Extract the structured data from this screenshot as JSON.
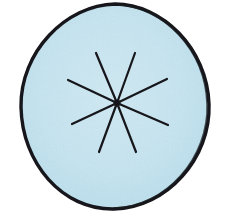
{
  "figure": {
    "title": "Hand-drawn circle with eight radiating spokes",
    "background_color": "#ffffff",
    "ink_color": "#15161a",
    "fill_color": "#c5e4f0",
    "fill_color_edge": "#b6dcec",
    "stroke_width_outline": 3.4,
    "stroke_width_spoke": 2.2,
    "canvas": {
      "width": 230,
      "height": 220
    }
  },
  "chart_data": {
    "type": "diagram",
    "title": "Circle with eight radiating spokes",
    "shapes": [
      {
        "name": "outer-circle",
        "kind": "ellipse",
        "center_x": 115,
        "center_y": 106,
        "radius_x": 94,
        "radius_y": 102,
        "fill": "#c5e4f0",
        "stroke": "#15161a",
        "stroke_width": 3.4
      }
    ],
    "center": {
      "x": 117,
      "y": 103
    },
    "spoke_count": 8,
    "spokes": [
      {
        "id": 1,
        "label": "upper-left-steep",
        "x1": 117,
        "y1": 103,
        "x2": 96,
        "y2": 53,
        "angle_deg": 113
      },
      {
        "id": 2,
        "label": "upper-left-shallow",
        "x1": 117,
        "y1": 103,
        "x2": 68,
        "y2": 80,
        "angle_deg": 155
      },
      {
        "id": 3,
        "label": "left-lower",
        "x1": 117,
        "y1": 103,
        "x2": 72,
        "y2": 124,
        "angle_deg": 205
      },
      {
        "id": 4,
        "label": "lower-left-steep",
        "x1": 117,
        "y1": 103,
        "x2": 99,
        "y2": 152,
        "angle_deg": 250
      },
      {
        "id": 5,
        "label": "lower-right-steep",
        "x1": 117,
        "y1": 103,
        "x2": 136,
        "y2": 152,
        "angle_deg": 291
      },
      {
        "id": 6,
        "label": "right-lower",
        "x1": 117,
        "y1": 103,
        "x2": 168,
        "y2": 125,
        "angle_deg": 336
      },
      {
        "id": 7,
        "label": "right-upper",
        "x1": 117,
        "y1": 103,
        "x2": 167,
        "y2": 79,
        "angle_deg": 26
      },
      {
        "id": 8,
        "label": "upper-right-steep",
        "x1": 117,
        "y1": 103,
        "x2": 135,
        "y2": 53,
        "angle_deg": 70
      }
    ],
    "xlabel": "",
    "ylabel": "",
    "grid": false,
    "legend": null
  }
}
